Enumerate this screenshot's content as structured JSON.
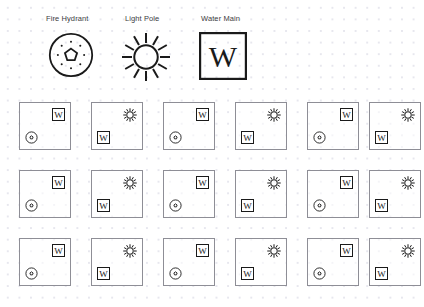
{
  "canvas": {
    "width": 424,
    "height": 307,
    "background_color": "#ffffff",
    "dot_grid_color": "#e7e7ee",
    "stroke_color": "#1a1a1a",
    "card_border_color": "#8e8e96",
    "label_color": "#3c3c42"
  },
  "legend": {
    "items": [
      {
        "label": "Fire Hydrant",
        "icon": "fire-hydrant-icon",
        "x": 46,
        "y": 14,
        "glyph_x": 48,
        "glyph_y": 27
      },
      {
        "label": "Light Pole",
        "icon": "light-pole-icon",
        "x": 125,
        "y": 14,
        "glyph_x": 121,
        "glyph_y": 27
      },
      {
        "label": "Water Main",
        "icon": "water-main-icon",
        "symbol_letter": "W",
        "x": 201,
        "y": 14,
        "glyph_x": 199,
        "glyph_y": 27
      }
    ]
  },
  "grid": {
    "columns": 6,
    "rows": 3,
    "card_width": 52,
    "card_height": 48,
    "col_x": [
      19,
      91,
      163,
      235,
      307,
      369
    ],
    "row_y": [
      102,
      170,
      238
    ],
    "cards": [
      {
        "row": 0,
        "col": 0,
        "top_right": "water-main-icon",
        "bottom_left": "fire-hydrant-icon"
      },
      {
        "row": 0,
        "col": 1,
        "top_right": "light-pole-icon",
        "bottom_left": "water-main-icon"
      },
      {
        "row": 0,
        "col": 2,
        "top_right": "water-main-icon",
        "bottom_left": "fire-hydrant-icon"
      },
      {
        "row": 0,
        "col": 3,
        "top_right": "light-pole-icon",
        "bottom_left": "water-main-icon"
      },
      {
        "row": 0,
        "col": 4,
        "top_right": "water-main-icon",
        "bottom_left": "fire-hydrant-icon"
      },
      {
        "row": 0,
        "col": 5,
        "top_right": "light-pole-icon",
        "bottom_left": "water-main-icon"
      },
      {
        "row": 1,
        "col": 0,
        "top_right": "water-main-icon",
        "bottom_left": "fire-hydrant-icon"
      },
      {
        "row": 1,
        "col": 1,
        "top_right": "light-pole-icon",
        "bottom_left": "water-main-icon"
      },
      {
        "row": 1,
        "col": 2,
        "top_right": "water-main-icon",
        "bottom_left": "fire-hydrant-icon"
      },
      {
        "row": 1,
        "col": 3,
        "top_right": "light-pole-icon",
        "bottom_left": "water-main-icon"
      },
      {
        "row": 1,
        "col": 4,
        "top_right": "water-main-icon",
        "bottom_left": "fire-hydrant-icon"
      },
      {
        "row": 1,
        "col": 5,
        "top_right": "light-pole-icon",
        "bottom_left": "water-main-icon"
      },
      {
        "row": 2,
        "col": 0,
        "top_right": "water-main-icon",
        "bottom_left": "fire-hydrant-icon"
      },
      {
        "row": 2,
        "col": 1,
        "top_right": "light-pole-icon",
        "bottom_left": "water-main-icon"
      },
      {
        "row": 2,
        "col": 2,
        "top_right": "water-main-icon",
        "bottom_left": "fire-hydrant-icon"
      },
      {
        "row": 2,
        "col": 3,
        "top_right": "light-pole-icon",
        "bottom_left": "water-main-icon"
      },
      {
        "row": 2,
        "col": 4,
        "top_right": "water-main-icon",
        "bottom_left": "fire-hydrant-icon"
      },
      {
        "row": 2,
        "col": 5,
        "top_right": "light-pole-icon",
        "bottom_left": "water-main-icon"
      }
    ]
  },
  "symbols": {
    "water_main_letter": "W"
  }
}
